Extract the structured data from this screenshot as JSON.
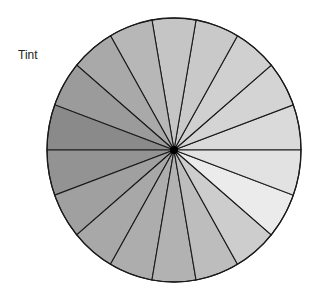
{
  "label": "Tint",
  "wheel": {
    "center": [
      174,
      150
    ],
    "rx": 127,
    "ry": 132,
    "segment_count": 18,
    "segment_angle_deg": 20,
    "outline_color": "#1a1a1a",
    "center_dot_color": "#000000",
    "segments": [
      {
        "from": 0,
        "to": 20,
        "fill": "#dadada"
      },
      {
        "from": 20,
        "to": 40,
        "fill": "#d4d4d4"
      },
      {
        "from": 40,
        "to": 60,
        "fill": "#d0d0d0"
      },
      {
        "from": 60,
        "to": 80,
        "fill": "#c9c9c9"
      },
      {
        "from": 80,
        "to": 100,
        "fill": "#c5c5c5"
      },
      {
        "from": 100,
        "to": 120,
        "fill": "#b7b7b7"
      },
      {
        "from": 120,
        "to": 140,
        "fill": "#a9a9a9"
      },
      {
        "from": 140,
        "to": 160,
        "fill": "#9b9b9b"
      },
      {
        "from": 160,
        "to": 180,
        "fill": "#8a8a8a"
      },
      {
        "from": 180,
        "to": 200,
        "fill": "#939393"
      },
      {
        "from": 200,
        "to": 220,
        "fill": "#a0a0a0"
      },
      {
        "from": 220,
        "to": 240,
        "fill": "#a8a8a8"
      },
      {
        "from": 240,
        "to": 260,
        "fill": "#adadad"
      },
      {
        "from": 260,
        "to": 280,
        "fill": "#b2b2b2"
      },
      {
        "from": 280,
        "to": 300,
        "fill": "#bdbdbd"
      },
      {
        "from": 300,
        "to": 320,
        "fill": "#cdcdcd"
      },
      {
        "from": 320,
        "to": 340,
        "fill": "#ebebeb"
      },
      {
        "from": 340,
        "to": 360,
        "fill": "#e2e2e2"
      }
    ]
  }
}
